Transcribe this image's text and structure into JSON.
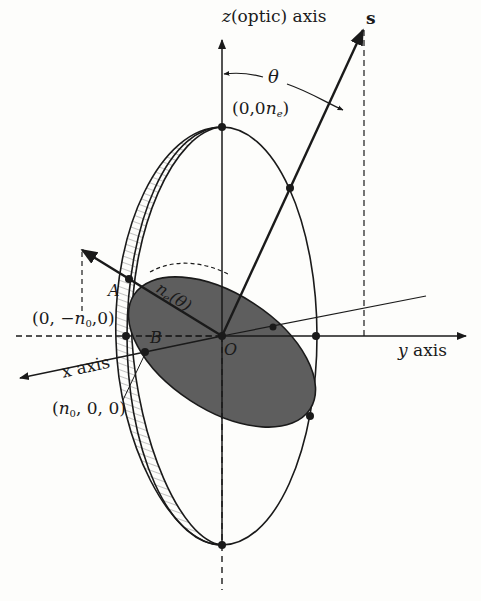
{
  "figure": {
    "labels": {
      "z_axis": "z",
      "z_axis_suffix": "(optic) axis",
      "s_vector": "s",
      "theta": "θ",
      "top_point_pre": "(0,0",
      "top_point_var": "n",
      "top_point_sub": "e",
      "top_point_post": ")",
      "neg_y_point_pre": "(0, −",
      "neg_y_point_var": "n",
      "neg_y_point_sub": "0",
      "neg_y_point_post": ",0)",
      "x_point_pre": "(",
      "x_point_var": "n",
      "x_point_sub": "0",
      "x_point_post": ", 0, 0)",
      "point_A": "A",
      "point_B": "B",
      "origin": "O",
      "ne_theta_var": "n",
      "ne_theta_sub": "e",
      "ne_theta_arg": "(θ)",
      "y_axis_var": "y",
      "y_axis_suffix": " axis",
      "x_axis": "x axis"
    },
    "colors": {
      "ink": "#1a1a1a",
      "shaded_ellipse": "#5e5e5e",
      "hatch": "#8a8a8a",
      "background": "#fdfdfb"
    }
  }
}
